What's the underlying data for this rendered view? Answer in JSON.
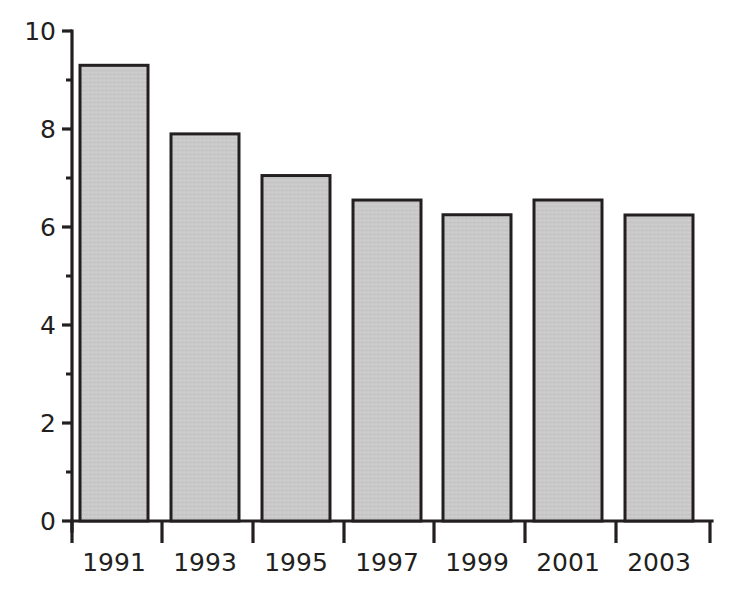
{
  "chart_data": {
    "type": "bar",
    "title": "",
    "subtitle": "",
    "xlabel": "",
    "ylabel": "",
    "categories": [
      "1991",
      "1993",
      "1995",
      "1997",
      "1999",
      "2001",
      "2003"
    ],
    "values": [
      9.7,
      9.9,
      9.3,
      7.9,
      7.05,
      6.55,
      6.25
    ],
    "series": [
      {
        "name": "",
        "values": [
          9.7,
          9.9,
          9.3,
          7.9,
          7.05,
          6.55,
          6.25
        ]
      }
    ],
    "ylim": [
      0,
      10
    ],
    "ytick_labels": [
      "0",
      "2",
      "4",
      "6",
      "8",
      "10"
    ],
    "ytick_values": [
      0,
      2,
      4,
      6,
      8,
      10
    ],
    "yminor_tick_values": [
      1,
      3,
      5,
      7,
      9
    ],
    "xtick_labels": [
      "1991",
      "1993",
      "1995",
      "1997",
      "1999",
      "2001",
      "2003"
    ],
    "grid": false,
    "legend": null,
    "legend_position": "none",
    "annotations": [],
    "colors": {
      "bar_fill": "#c9c9c9",
      "bar_edge": "#231f20",
      "axis": "#231f20",
      "text": "#231f20",
      "background": "#ffffff"
    }
  }
}
